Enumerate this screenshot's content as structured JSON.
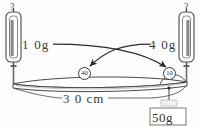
{
  "figure": {
    "type": "physics-diagram",
    "colors": {
      "ink": "#2b2b2b",
      "line": "#3a3a3a",
      "fill_gray": "#8a8a8a",
      "background": "#fdfdfd"
    }
  },
  "gauges": {
    "left": {
      "reading_label": "?",
      "name": "left-spring-scale"
    },
    "right": {
      "reading_label": "?",
      "name": "right-spring-scale"
    }
  },
  "mass_labels": {
    "left": "1 0g",
    "right": "4 0g"
  },
  "markers": {
    "left_circle": "40",
    "right_circle": "10"
  },
  "beam": {
    "length_label": "3 0 cm"
  },
  "hanging_weight": {
    "label": "50g"
  }
}
